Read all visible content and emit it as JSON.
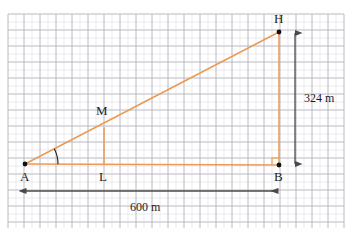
{
  "figure": {
    "width": 351,
    "height": 238,
    "background": "#ffffff",
    "colors": {
      "triangle": "#ec9a53",
      "dimension": "#4a4a4a",
      "grid_major": "#b2b2bb",
      "grid_minor": "#e3e3ea",
      "point": "#111111",
      "label": "#1b1b1b"
    },
    "grid": {
      "visible": true,
      "x_start": 8,
      "x_end": 344,
      "y_start": 14,
      "y_end": 228,
      "major_step": 16,
      "minor_step": 8
    },
    "points": [
      {
        "id": "A",
        "label": "A",
        "x": 25,
        "y": 164,
        "label_x": 20,
        "label_y": 170,
        "dot": true
      },
      {
        "id": "B",
        "label": "B",
        "x": 279,
        "y": 165,
        "label_x": 274,
        "label_y": 170,
        "dot": true
      },
      {
        "id": "H",
        "label": "H",
        "x": 279,
        "y": 32,
        "label_x": 274,
        "label_y": 12,
        "dot": true
      },
      {
        "id": "L",
        "label": "L",
        "x": 104,
        "y": 164,
        "label_x": 99,
        "label_y": 170,
        "dot": false
      },
      {
        "id": "M",
        "label": "M",
        "x": 104,
        "y": 128,
        "label_x": 96,
        "label_y": 104,
        "dot": false
      }
    ],
    "segments": [
      {
        "name": "base-AB",
        "from": "A",
        "to": "B",
        "color": "triangle"
      },
      {
        "name": "hypotenuse-AH",
        "from": "A",
        "to": "H",
        "color": "triangle"
      },
      {
        "name": "vertical-HB",
        "from": "H",
        "to": "B",
        "color": "triangle"
      },
      {
        "name": "midsegment-ML",
        "from": "M",
        "to": "L",
        "color": "triangle"
      }
    ],
    "angle_mark": {
      "name": "angle-at-A",
      "vertex": "A",
      "style": "arc"
    },
    "right_angle_mark": {
      "name": "right-angle-at-B",
      "vertex": "B",
      "style": "square"
    },
    "dimensions": [
      {
        "name": "height-dimension",
        "label": "324 m",
        "orientation": "vertical",
        "x": 295,
        "y1": 32,
        "y2": 165,
        "label_x": 304,
        "label_y": 92
      },
      {
        "name": "base-dimension",
        "label": "600 m",
        "orientation": "horizontal",
        "y": 191,
        "x1": 25,
        "x2": 279,
        "label_x": 130,
        "label_y": 201
      }
    ]
  }
}
